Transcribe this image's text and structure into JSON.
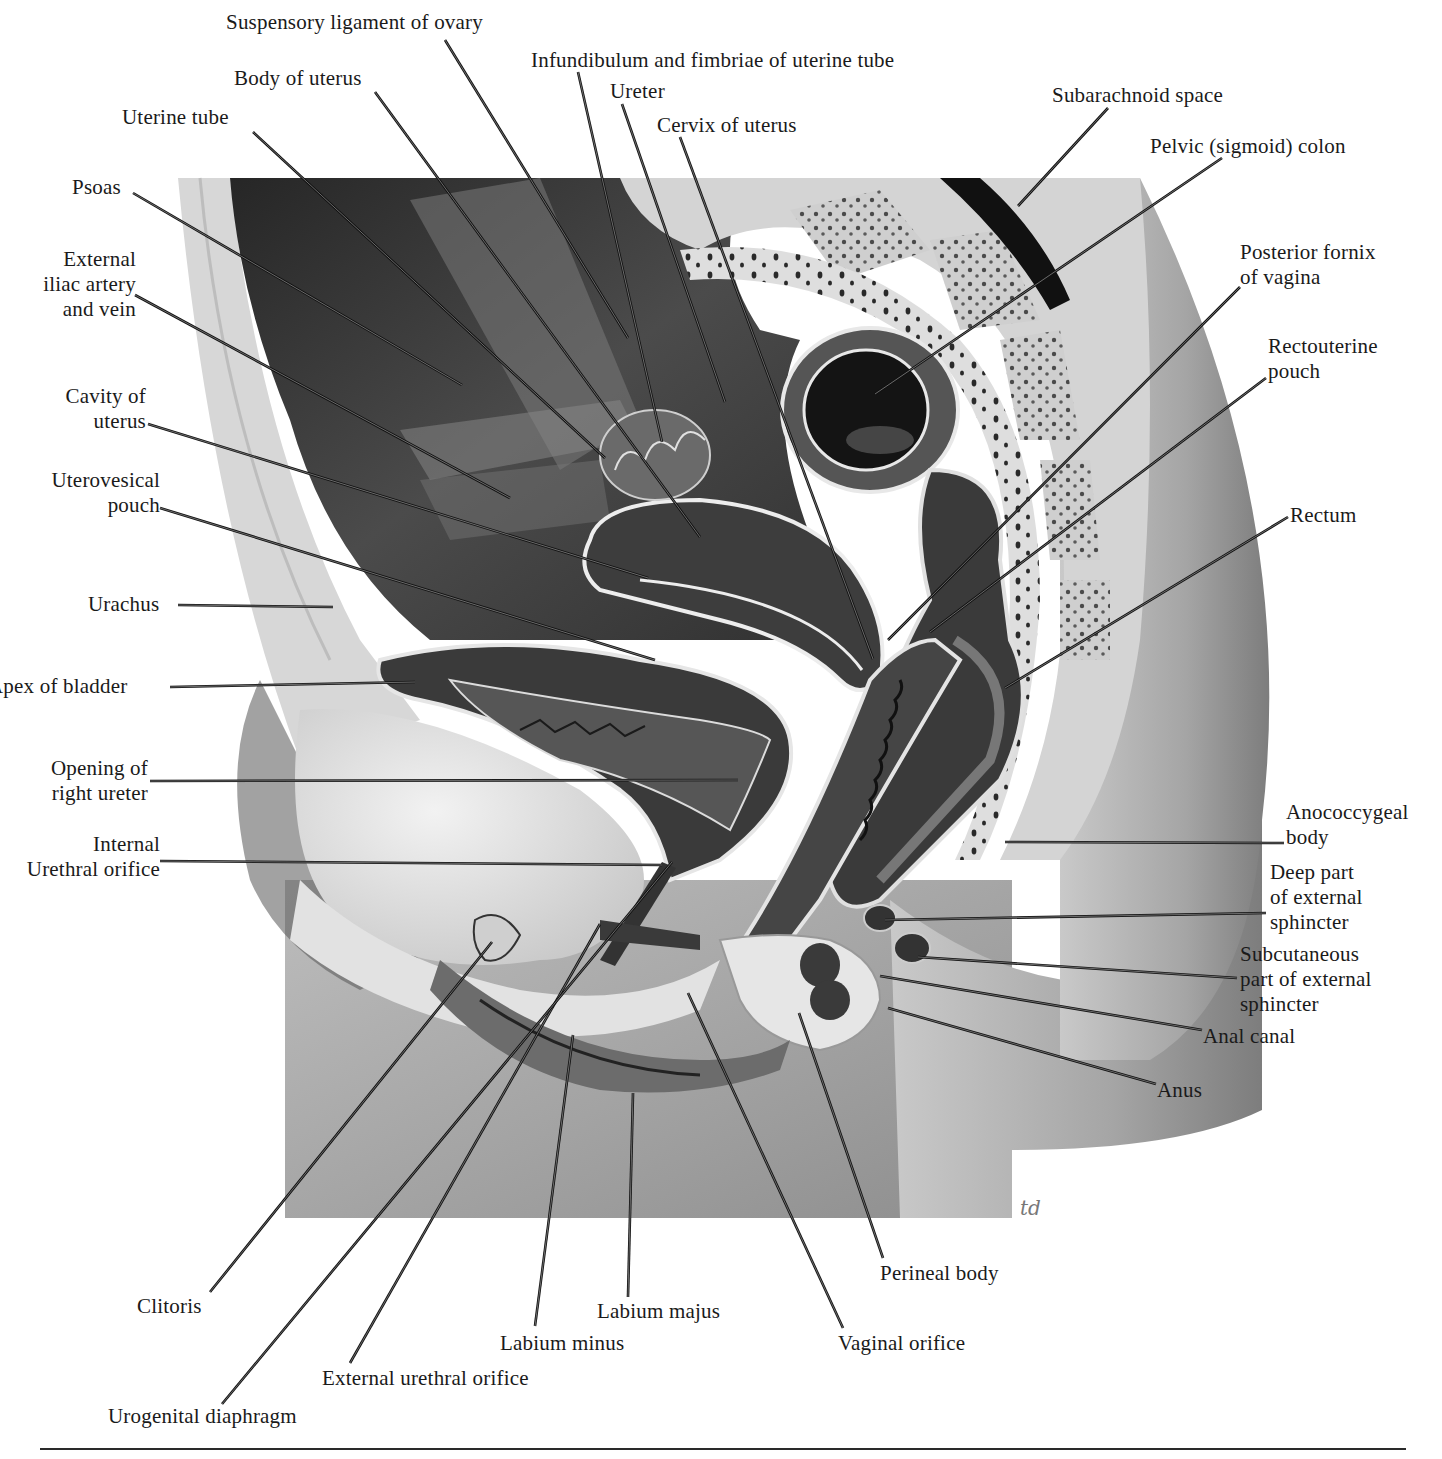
{
  "figure": {
    "signature": "td",
    "colors": {
      "background": "#ffffff",
      "frame": "#a8a8a8",
      "dark_tissue": "#2e2e2e",
      "mid_tissue": "#4a4a4a",
      "light_tissue": "#d9d9d9",
      "skin": "#9a9a9a",
      "leader_line": "#111111",
      "text": "#1a1a1a"
    }
  },
  "labels": [
    {
      "id": "suspensory-ligament-of-ovary",
      "lines": [
        "Suspensory ligament of ovary"
      ],
      "x": 226,
      "y": 10,
      "align": "left",
      "anchor": [
        445,
        40
      ],
      "target": [
        628,
        338
      ]
    },
    {
      "id": "infundibulum-and-fimbriae",
      "lines": [
        "Infundibulum and fimbriae of uterine tube"
      ],
      "x": 531,
      "y": 48,
      "align": "left",
      "anchor": [
        578,
        72
      ],
      "target": [
        662,
        442
      ]
    },
    {
      "id": "body-of-uterus",
      "lines": [
        "Body of uterus"
      ],
      "x": 234,
      "y": 66,
      "align": "left",
      "anchor": [
        375,
        92
      ],
      "target": [
        700,
        537
      ]
    },
    {
      "id": "ureter",
      "lines": [
        "Ureter"
      ],
      "x": 610,
      "y": 79,
      "align": "left",
      "anchor": [
        622,
        104
      ],
      "target": [
        725,
        402
      ]
    },
    {
      "id": "uterine-tube",
      "lines": [
        "Uterine tube"
      ],
      "x": 122,
      "y": 105,
      "align": "left",
      "anchor": [
        253,
        132
      ],
      "target": [
        605,
        458
      ]
    },
    {
      "id": "cervix-of-uterus",
      "lines": [
        "Cervix of uterus"
      ],
      "x": 657,
      "y": 113,
      "align": "left",
      "anchor": [
        680,
        137
      ],
      "target": [
        873,
        659
      ]
    },
    {
      "id": "subarachnoid-space",
      "lines": [
        "Subarachnoid space"
      ],
      "x": 1052,
      "y": 83,
      "align": "left",
      "anchor": [
        1108,
        108
      ],
      "target": [
        1018,
        206
      ]
    },
    {
      "id": "pelvic-sigmoid-colon",
      "lines": [
        "Pelvic (sigmoid) colon"
      ],
      "x": 1150,
      "y": 134,
      "align": "left",
      "anchor": [
        1222,
        158
      ],
      "target": [
        875,
        394
      ]
    },
    {
      "id": "psoas",
      "lines": [
        "Psoas"
      ],
      "x": 72,
      "y": 175,
      "align": "left",
      "anchor": [
        133,
        193
      ],
      "target": [
        462,
        385
      ]
    },
    {
      "id": "external-iliac-artery-and-vein",
      "lines": [
        "External",
        "iliac artery",
        "and vein"
      ],
      "x": 18,
      "y": 247,
      "align": "right",
      "w": 118,
      "anchor": [
        135,
        295
      ],
      "target": [
        510,
        498
      ]
    },
    {
      "id": "posterior-fornix-of-vagina",
      "lines": [
        "Posterior fornix",
        "of vagina"
      ],
      "x": 1240,
      "y": 240,
      "align": "left",
      "anchor": [
        1240,
        287
      ],
      "target": [
        888,
        640
      ]
    },
    {
      "id": "rectouterine-pouch",
      "lines": [
        "Rectouterine",
        "pouch"
      ],
      "x": 1268,
      "y": 334,
      "align": "left",
      "anchor": [
        1266,
        378
      ],
      "target": [
        930,
        632
      ]
    },
    {
      "id": "cavity-of-uterus",
      "lines": [
        "Cavity of",
        "uterus"
      ],
      "x": 46,
      "y": 384,
      "align": "right",
      "w": 100,
      "anchor": [
        148,
        424
      ],
      "target": [
        648,
        578
      ]
    },
    {
      "id": "uterovesical-pouch",
      "lines": [
        "Uterovesical",
        "pouch"
      ],
      "x": 30,
      "y": 468,
      "align": "right",
      "w": 130,
      "anchor": [
        160,
        508
      ],
      "target": [
        655,
        660
      ]
    },
    {
      "id": "rectum",
      "lines": [
        "Rectum"
      ],
      "x": 1290,
      "y": 503,
      "align": "left",
      "anchor": [
        1288,
        517
      ],
      "target": [
        1005,
        688
      ]
    },
    {
      "id": "urachus",
      "lines": [
        "Urachus"
      ],
      "x": 88,
      "y": 592,
      "align": "left",
      "anchor": [
        178,
        605
      ],
      "target": [
        333,
        607
      ]
    },
    {
      "id": "apex-of-bladder",
      "lines": [
        "Apex of bladder"
      ],
      "x": -12,
      "y": 674,
      "align": "left",
      "anchor": [
        170,
        687
      ],
      "target": [
        415,
        682
      ]
    },
    {
      "id": "opening-of-right-ureter",
      "lines": [
        "Opening of",
        "right ureter"
      ],
      "x": 22,
      "y": 756,
      "align": "right",
      "w": 126,
      "anchor": [
        150,
        781
      ],
      "target": [
        738,
        780
      ]
    },
    {
      "id": "internal-urethral-orifice",
      "lines": [
        "Internal",
        "Urethral orifice"
      ],
      "x": -14,
      "y": 832,
      "align": "right",
      "w": 174,
      "anchor": [
        160,
        861
      ],
      "target": [
        662,
        865
      ]
    },
    {
      "id": "anococcygeal-body",
      "lines": [
        "Anococcygeal",
        "body"
      ],
      "x": 1286,
      "y": 800,
      "align": "left",
      "anchor": [
        1284,
        843
      ],
      "target": [
        1005,
        842
      ]
    },
    {
      "id": "deep-part-of-external-sphincter",
      "lines": [
        "Deep part",
        "of external",
        "sphincter"
      ],
      "x": 1270,
      "y": 860,
      "align": "left",
      "anchor": [
        1266,
        913
      ],
      "target": [
        885,
        920
      ]
    },
    {
      "id": "subcutaneous-part-of-external-sphincter",
      "lines": [
        "Subcutaneous",
        "part of external",
        "sphincter"
      ],
      "x": 1240,
      "y": 942,
      "align": "left",
      "anchor": [
        1237,
        978
      ],
      "target": [
        918,
        957
      ]
    },
    {
      "id": "anal-canal",
      "lines": [
        "Anal canal"
      ],
      "x": 1203,
      "y": 1024,
      "align": "left",
      "anchor": [
        1202,
        1030
      ],
      "target": [
        880,
        976
      ]
    },
    {
      "id": "anus",
      "lines": [
        "Anus"
      ],
      "x": 1157,
      "y": 1078,
      "align": "left",
      "anchor": [
        1156,
        1084
      ],
      "target": [
        888,
        1008
      ]
    },
    {
      "id": "clitoris",
      "lines": [
        "Clitoris"
      ],
      "x": 137,
      "y": 1294,
      "align": "left",
      "anchor": [
        210,
        1292
      ],
      "target": [
        492,
        942
      ]
    },
    {
      "id": "perineal-body",
      "lines": [
        "Perineal body"
      ],
      "x": 880,
      "y": 1261,
      "align": "left",
      "anchor": [
        883,
        1258
      ],
      "target": [
        799,
        1013
      ]
    },
    {
      "id": "labium-majus",
      "lines": [
        "Labium majus"
      ],
      "x": 597,
      "y": 1299,
      "align": "left",
      "anchor": [
        628,
        1297
      ],
      "target": [
        633,
        1093
      ]
    },
    {
      "id": "labium-minus",
      "lines": [
        "Labium minus"
      ],
      "x": 500,
      "y": 1331,
      "align": "left",
      "anchor": [
        535,
        1326
      ],
      "target": [
        573,
        1035
      ]
    },
    {
      "id": "vaginal-orifice",
      "lines": [
        "Vaginal orifice"
      ],
      "x": 838,
      "y": 1331,
      "align": "left",
      "anchor": [
        843,
        1328
      ],
      "target": [
        688,
        993
      ]
    },
    {
      "id": "external-urethral-orifice",
      "lines": [
        "External urethral orifice"
      ],
      "x": 322,
      "y": 1366,
      "align": "left",
      "anchor": [
        350,
        1363
      ],
      "target": [
        600,
        924
      ]
    },
    {
      "id": "urogenital-diaphragm",
      "lines": [
        "Urogenital diaphragm"
      ],
      "x": 108,
      "y": 1404,
      "align": "left",
      "anchor": [
        222,
        1404
      ],
      "target": [
        672,
        862
      ]
    }
  ]
}
